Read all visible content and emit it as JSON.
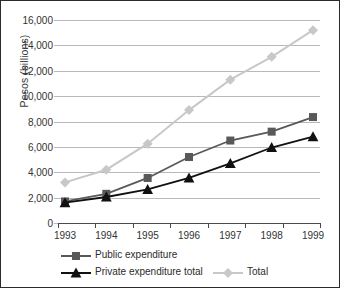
{
  "chart_data": {
    "type": "line",
    "title": "",
    "xlabel": "",
    "ylabel": "Pesos (billions)",
    "categories": [
      "1993",
      "1994",
      "1995",
      "1996",
      "1997",
      "1998",
      "1999"
    ],
    "ylim": [
      0,
      16000
    ],
    "y_ticks": [
      0,
      2000,
      4000,
      6000,
      8000,
      10000,
      12000,
      14000,
      16000
    ],
    "y_tick_labels": [
      "0",
      "2,000",
      "4,000",
      "6,000",
      "8,000",
      "10,000",
      "12,000",
      "14,000",
      "16,000"
    ],
    "grid": true,
    "legend_position": "bottom",
    "series": [
      {
        "name": "Public expenditure",
        "color": "#595959",
        "marker": "square",
        "values": [
          1700,
          2300,
          3550,
          5200,
          6500,
          7200,
          8350
        ]
      },
      {
        "name": "Private expenditure total",
        "color": "#111111",
        "marker": "triangle",
        "values": [
          1600,
          2050,
          2650,
          3550,
          4700,
          5950,
          6800
        ]
      },
      {
        "name": "Total",
        "color": "#c8c8c8",
        "marker": "diamond",
        "values": [
          3200,
          4200,
          6250,
          8900,
          11300,
          13100,
          15200
        ]
      }
    ]
  },
  "legend": {
    "items": [
      {
        "label": "Public expenditure"
      },
      {
        "label": "Private expenditure total"
      },
      {
        "label": "Total"
      }
    ]
  }
}
